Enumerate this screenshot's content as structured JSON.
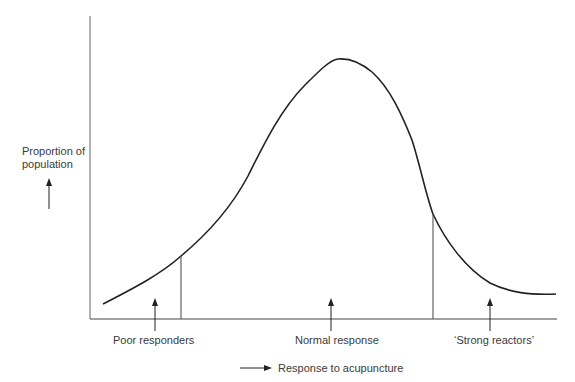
{
  "diagram": {
    "type": "distribution-curve",
    "y_axis_label_line1": "Proportion of",
    "y_axis_label_line2": "population",
    "x_axis_label": "Response to acupuncture",
    "regions": [
      {
        "label": "Poor responders"
      },
      {
        "label": "Normal response"
      },
      {
        "label": "‘Strong reactors’"
      }
    ],
    "colors": {
      "line": "#222222",
      "axis": "#555555",
      "text": "#3a3a3a"
    }
  }
}
